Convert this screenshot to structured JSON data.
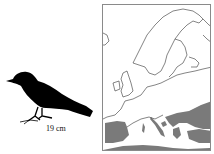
{
  "header_fragment": "··· ···",
  "species_figure": {
    "silhouette": "bird-silhouette",
    "size_label": "19 cm"
  },
  "range_map": {
    "region": "Europe",
    "range_color": "#7a7a7a",
    "land_color": "#ffffff",
    "coast_color": "#333333",
    "frame_color": "#8a8a8a"
  }
}
